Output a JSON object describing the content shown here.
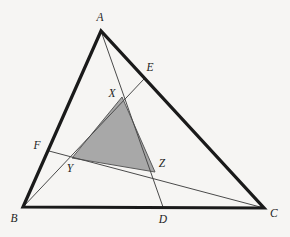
{
  "figure": {
    "type": "geometry-diagram",
    "canvas": {
      "width": 290,
      "height": 237
    },
    "background_color": "#f6f5f3",
    "outline_color": "#1a1a1a",
    "cevian_color": "#4a4a4a",
    "shaded_fill_color": "#a8a8a8",
    "shaded_stroke_color": "#5a5a5a",
    "label_color": "#1d1d1d"
  },
  "points": {
    "A": {
      "label": "A",
      "x": 101,
      "y": 31,
      "label_x": 100,
      "label_y": 18,
      "kind": "triangle-vertex"
    },
    "B": {
      "label": "B",
      "x": 23,
      "y": 207,
      "label_x": 14,
      "label_y": 219,
      "kind": "triangle-vertex"
    },
    "C": {
      "label": "C",
      "x": 264,
      "y": 208,
      "label_x": 274,
      "label_y": 214,
      "kind": "triangle-vertex"
    },
    "D": {
      "label": "D",
      "x": 163,
      "y": 207,
      "label_x": 163,
      "label_y": 220,
      "kind": "side-point-on-BC"
    },
    "E": {
      "label": "E",
      "x": 144,
      "y": 79,
      "label_x": 150,
      "label_y": 68,
      "kind": "side-point-on-AC"
    },
    "F": {
      "label": "F",
      "x": 49,
      "y": 151,
      "label_x": 37,
      "label_y": 146,
      "kind": "side-point-on-AB"
    },
    "X": {
      "label": "X",
      "x": 122,
      "y": 97,
      "label_x": 112,
      "label_y": 94,
      "kind": "cevian-intersection"
    },
    "Y": {
      "label": "Y",
      "x": 72,
      "y": 158,
      "label_x": 70,
      "label_y": 169,
      "kind": "cevian-intersection"
    },
    "Z": {
      "label": "Z",
      "x": 155,
      "y": 172,
      "label_x": 162,
      "label_y": 164,
      "kind": "cevian-intersection"
    }
  },
  "triangle_outline": {
    "name": "triangle-ABC",
    "path": "M 101 31 L 23 207 L 264 208 Z",
    "stroke_width": 3.2
  },
  "cevians": [
    {
      "name": "cevian-A-to-D",
      "from": "A",
      "to": "D",
      "x1": 101,
      "y1": 31,
      "x2": 163,
      "y2": 207,
      "stroke_width": 1.0
    },
    {
      "name": "cevian-B-to-E",
      "from": "B",
      "to": "E",
      "x1": 23,
      "y1": 207,
      "x2": 144,
      "y2": 79,
      "stroke_width": 1.0
    },
    {
      "name": "cevian-F-to-C",
      "from": "F",
      "to": "C",
      "x1": 49,
      "y1": 151,
      "x2": 264,
      "y2": 208,
      "stroke_width": 1.0
    }
  ],
  "shaded_triangle": {
    "name": "shaded-triangle-XYZ",
    "vertices": [
      "X",
      "Y",
      "Z"
    ],
    "path": "M 122 97 L 72 158 L 155 172 Z",
    "stroke_width": 1.0
  },
  "labels": [
    {
      "key": "A",
      "text": "A"
    },
    {
      "key": "B",
      "text": "B"
    },
    {
      "key": "C",
      "text": "C"
    },
    {
      "key": "D",
      "text": "D"
    },
    {
      "key": "E",
      "text": "E"
    },
    {
      "key": "F",
      "text": "F"
    },
    {
      "key": "X",
      "text": "X"
    },
    {
      "key": "Y",
      "text": "Y"
    },
    {
      "key": "Z",
      "text": "Z"
    }
  ]
}
